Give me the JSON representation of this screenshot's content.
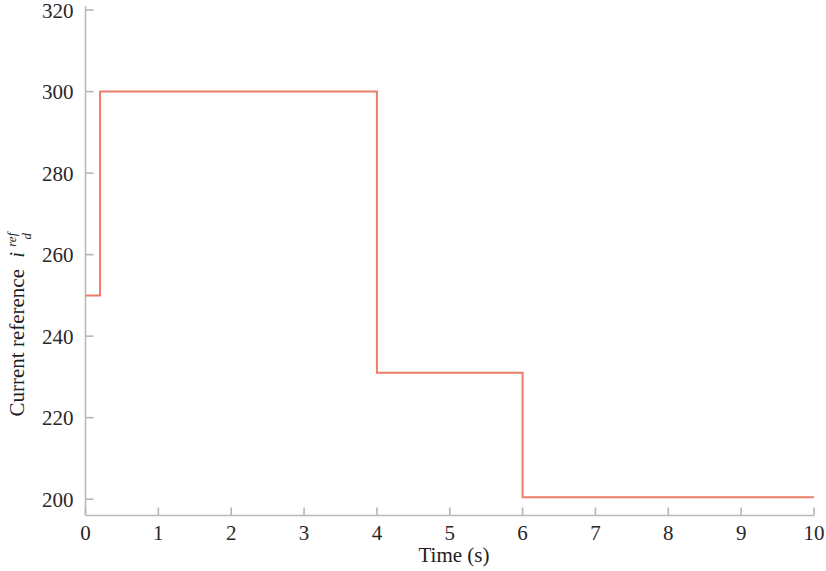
{
  "chart_data": {
    "type": "line",
    "title": "",
    "subtitle": "",
    "xlabel": "Time (s)",
    "ylabel": "Current reference i_d^ref",
    "ylabel_parts": {
      "text": "Current reference",
      "symbol": "i",
      "superscript": "ref",
      "subscript": "d"
    },
    "xlim": [
      0,
      10
    ],
    "ylim": [
      196,
      321
    ],
    "xticks": [
      0,
      1,
      2,
      3,
      4,
      5,
      6,
      7,
      8,
      9,
      10
    ],
    "xtick_labels": [
      "0",
      "1",
      "2",
      "3",
      "4",
      "5",
      "6",
      "7",
      "8",
      "9",
      "10"
    ],
    "yticks": [
      200,
      220,
      240,
      260,
      280,
      300,
      320
    ],
    "ytick_labels": [
      "200",
      "220",
      "240",
      "260",
      "280",
      "300",
      "320"
    ],
    "grid": false,
    "legend": null,
    "legend_position": "none",
    "series": [
      {
        "name": "Current reference id_ref",
        "style": "step",
        "color": "#ED7D6A",
        "line_width": 2,
        "x": [
          0.0,
          0.2,
          0.2,
          4.0,
          4.0,
          6.0,
          6.0,
          10.0
        ],
        "y": [
          250,
          250,
          300,
          300,
          231,
          231,
          200.5,
          200.5
        ]
      }
    ],
    "step_levels": [
      {
        "t_start": 0.0,
        "t_end": 0.2,
        "value": 250
      },
      {
        "t_start": 0.2,
        "t_end": 4.0,
        "value": 300
      },
      {
        "t_start": 4.0,
        "t_end": 6.0,
        "value": 231
      },
      {
        "t_start": 6.0,
        "t_end": 10.0,
        "value": 200.5
      }
    ],
    "axis_color": "#b9b5b6",
    "background": "#ffffff"
  }
}
